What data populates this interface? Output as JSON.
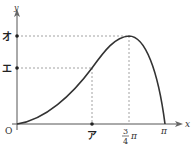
{
  "diagram": {
    "type": "function-graph",
    "axes": {
      "x_label": "x",
      "y_label": "y",
      "origin_label": "O"
    },
    "x_ticks": [
      {
        "label": "ア",
        "role": "unknown-x"
      },
      {
        "label_num": "3",
        "label_den": "4",
        "label_suffix": "π",
        "value": "3/4π"
      },
      {
        "label": "π",
        "value": "π"
      }
    ],
    "y_ticks": [
      {
        "label": "オ",
        "role": "maximum-value"
      },
      {
        "label": "エ",
        "role": "value-at-ア"
      }
    ],
    "curve": {
      "description": "curve starting at origin, rising to a maximum at x = 3/4π, then falling to zero at x = π",
      "start": "O",
      "maximum_x": "3/4π",
      "maximum_y": "オ",
      "end_x": "π"
    },
    "colors": {
      "curve": "#333333",
      "axis": "#555555",
      "dashed": "#888888"
    }
  }
}
